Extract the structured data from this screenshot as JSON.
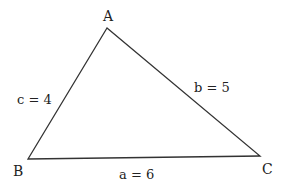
{
  "diagram": {
    "type": "triangle",
    "vertices": [
      {
        "name": "A",
        "x": 107,
        "y": 28
      },
      {
        "name": "B",
        "x": 28,
        "y": 159
      },
      {
        "name": "C",
        "x": 260,
        "y": 156
      }
    ],
    "sides": [
      {
        "name": "a",
        "label": "a = 6",
        "length": 6,
        "between": [
          "B",
          "C"
        ]
      },
      {
        "name": "b",
        "label": "b = 5",
        "length": 5,
        "between": [
          "A",
          "C"
        ]
      },
      {
        "name": "c",
        "label": "c = 4",
        "length": 4,
        "between": [
          "A",
          "B"
        ]
      }
    ],
    "colors": {
      "stroke": "#333333",
      "text": "#222222",
      "background": "#ffffff"
    }
  }
}
